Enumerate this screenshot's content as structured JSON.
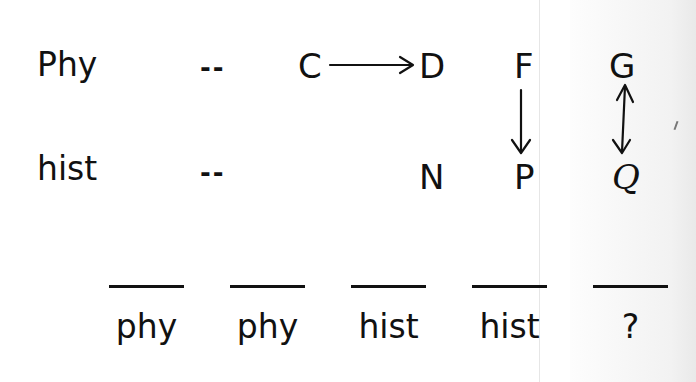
{
  "rows": {
    "top": {
      "label": "Phy",
      "placeholder": "--",
      "items": [
        "C",
        "D",
        "F",
        "G"
      ]
    },
    "bottom": {
      "label": "hist",
      "placeholder": "--",
      "items": [
        "N",
        "P",
        "Q"
      ]
    }
  },
  "relations": [
    {
      "from": "C",
      "to": "D",
      "type": "arrow-right"
    },
    {
      "from": "F",
      "to": "P",
      "type": "arrow-down"
    },
    {
      "from": "G",
      "to": "Q",
      "type": "double-arrow-vertical"
    }
  ],
  "answer_slots": [
    "phy",
    "phy",
    "hist",
    "hist",
    "?"
  ]
}
